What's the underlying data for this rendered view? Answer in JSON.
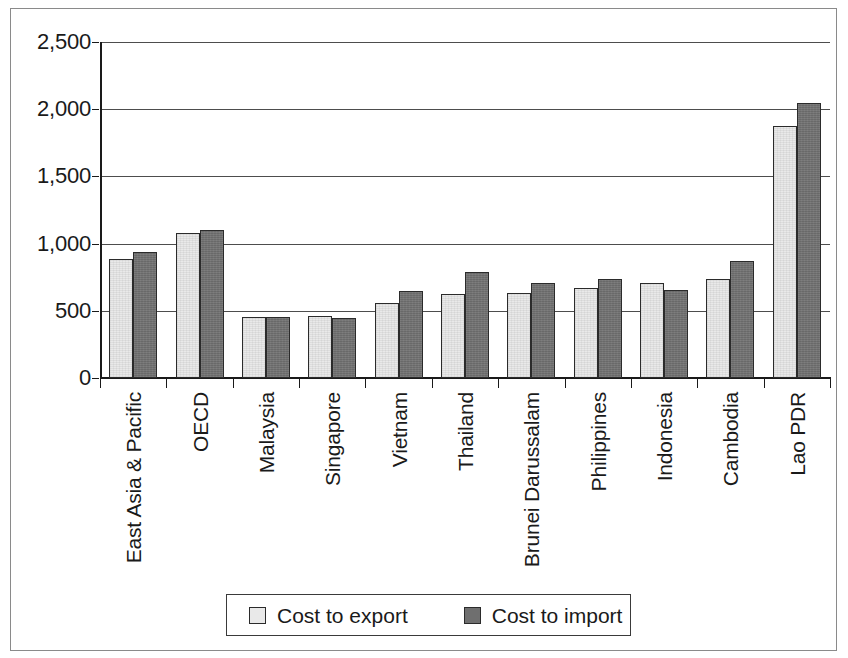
{
  "chart_data": {
    "type": "bar",
    "title": "",
    "subtitle": "",
    "xlabel": "",
    "ylabel": "",
    "ylim": [
      0,
      2500
    ],
    "ytick_labels": [
      "0",
      "500",
      "1,000",
      "1,500",
      "2,000",
      "2,500"
    ],
    "ytick_values": [
      0,
      500,
      1000,
      1500,
      2000,
      2500
    ],
    "grid": true,
    "grid_axis": "y",
    "legend_position": "bottom",
    "categories": [
      "East Asia & Pacific",
      "OECD",
      "Malaysia",
      "Singapore",
      "Vietnam",
      "Thailand",
      "Brunei Darussalam",
      "Philippines",
      "Indonesia",
      "Cambodia",
      "Lao PDR"
    ],
    "series": [
      {
        "name": "Cost to export",
        "color": "#e9e9e9",
        "values": [
          885,
          1080,
          455,
          460,
          560,
          625,
          630,
          670,
          705,
          735,
          1875
        ]
      },
      {
        "name": "Cost to import",
        "color": "#6f6f6f",
        "values": [
          935,
          1105,
          455,
          445,
          645,
          790,
          710,
          735,
          655,
          870,
          2045
        ]
      }
    ]
  },
  "legend": {
    "entries": [
      {
        "label": "Cost to export",
        "swatch": "light-gray-swatch"
      },
      {
        "label": "Cost to import",
        "swatch": "dark-gray-swatch"
      }
    ]
  }
}
